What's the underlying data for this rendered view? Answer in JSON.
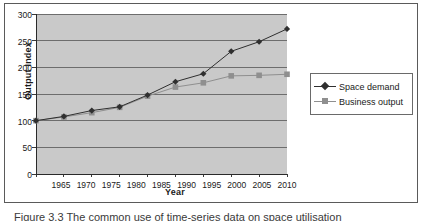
{
  "chart_data": {
    "type": "line",
    "title": "",
    "xlabel": "Year",
    "ylabel": "Output Index",
    "x": [
      1965,
      1970,
      1975,
      1980,
      1985,
      1990,
      1995,
      2000,
      2005,
      2010
    ],
    "xtick_labels": [
      "1965",
      "1970",
      "1975",
      "1980",
      "1985",
      "1990",
      "1995",
      "2000",
      "2005",
      "2010"
    ],
    "ytick_labels": [
      "0",
      "50",
      "100",
      "150",
      "200",
      "250",
      "300"
    ],
    "yticks": [
      0,
      50,
      100,
      150,
      200,
      250,
      300
    ],
    "ylim": [
      0,
      300
    ],
    "grid": "horizontal",
    "legend_position": "right",
    "plot_background": "#c9c9c9",
    "series": [
      {
        "name": "Space demand",
        "color": "#2f2f2f",
        "marker": "diamond",
        "values": [
          100,
          108,
          119,
          126,
          148,
          173,
          188,
          230,
          248,
          272
        ]
      },
      {
        "name": "Business output",
        "color": "#8f8f8f",
        "marker": "square",
        "values": [
          100,
          107,
          115,
          125,
          146,
          163,
          171,
          184,
          185,
          187
        ]
      }
    ]
  },
  "legend": {
    "items": [
      {
        "label": "Space demand"
      },
      {
        "label": "Business output"
      }
    ]
  },
  "caption": {
    "text": "Figure 3.3   The common use of time-series data on space utilisation"
  }
}
